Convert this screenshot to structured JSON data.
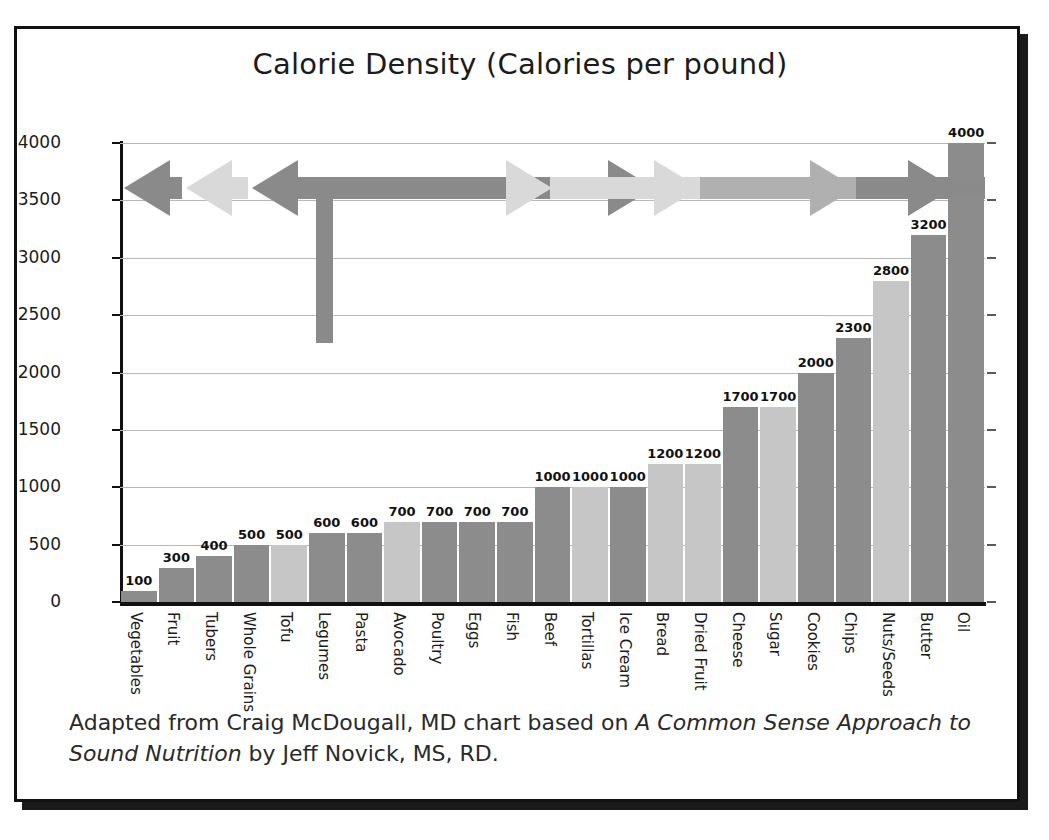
{
  "chart_data": {
    "type": "bar",
    "title": "Calorie Density (Calories per pound)",
    "xlabel": "",
    "ylabel": "",
    "ylim": [
      0,
      4000
    ],
    "yticks": [
      0,
      500,
      1000,
      1500,
      2000,
      2500,
      3000,
      3500,
      4000
    ],
    "ytick_labels": [
      "0",
      "500",
      "1000",
      "1500",
      "2000",
      "2500",
      "3000",
      "3500",
      "4000"
    ],
    "grid": true,
    "legend": "none",
    "categories": [
      "Vegetables",
      "Fruit",
      "Tubers",
      "Whole Grains",
      "Tofu",
      "Legumes",
      "Pasta",
      "Avocado",
      "Poultry",
      "Eggs",
      "Fish",
      "Beef",
      "Tortillas",
      "Ice Cream",
      "Bread",
      "Dried Fruit",
      "Cheese",
      "Sugar",
      "Cookies",
      "Chips",
      "Nuts/Seeds",
      "Butter",
      "Oil"
    ],
    "values": [
      100,
      300,
      400,
      500,
      500,
      600,
      600,
      700,
      700,
      700,
      700,
      1000,
      1000,
      1000,
      1200,
      1200,
      1700,
      1700,
      2000,
      2300,
      2800,
      3200,
      4000
    ],
    "value_labels": [
      "100",
      "300",
      "400",
      "500",
      "500",
      "600",
      "600",
      "700",
      "700",
      "700",
      "700",
      "1000",
      "1000",
      "1000",
      "1200",
      "1200",
      "1700",
      "1700",
      "2000",
      "2300",
      "2800",
      "3200",
      "4000"
    ],
    "bar_shades": [
      "dark",
      "dark",
      "dark",
      "dark",
      "light",
      "dark",
      "dark",
      "light",
      "dark",
      "dark",
      "dark",
      "dark",
      "light",
      "dark",
      "light",
      "light",
      "dark",
      "light",
      "dark",
      "dark",
      "light",
      "dark",
      "dark"
    ]
  },
  "colors": {
    "bar_dark": "#8c8c8c",
    "bar_light": "#c6c6c6",
    "arrow_dark": "#8a8a8a",
    "arrow_medium": "#b0b0b0",
    "arrow_light": "#d9d9d9",
    "frame": "#111111",
    "gridline": "#b8b8b8",
    "text": "#1c1c1c",
    "background": "#ffffff"
  },
  "arrows": {
    "description": "calorie-density continuum band across top of plot",
    "segments": [
      {
        "name": "leftmost-dark-left-arrow",
        "shade": "dark",
        "direction": "left"
      },
      {
        "name": "light-left-arrow",
        "shade": "light",
        "direction": "left"
      },
      {
        "name": "dark-left-arrow-with-stem",
        "shade": "dark",
        "direction": "left"
      },
      {
        "name": "dark-right-arrow",
        "shade": "dark",
        "direction": "right"
      },
      {
        "name": "light-right-arrow",
        "shade": "light",
        "direction": "right"
      },
      {
        "name": "medium-right-arrow",
        "shade": "medium",
        "direction": "right"
      },
      {
        "name": "dark-right-arrow-end",
        "shade": "dark",
        "direction": "right"
      }
    ],
    "down_arrow": {
      "name": "downward-pointer",
      "shade": "dark",
      "direction": "down"
    }
  },
  "caption": {
    "line1_a": "Adapted from Craig McDougall, MD chart based on ",
    "line1_italic": "A Common Sense Approach to",
    "line2_italic": "Sound Nutrition",
    "line2_b": " by Jeff Novick, MS, RD."
  }
}
